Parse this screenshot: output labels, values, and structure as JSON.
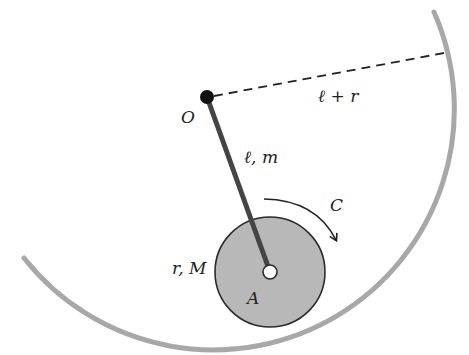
{
  "diagram": {
    "labels": {
      "pivot": "O",
      "rod": "ℓ, m",
      "track_radius": "ℓ + r",
      "couple": "C",
      "disc": "r, M",
      "disc_center": "A"
    },
    "colors": {
      "track": "#a8a8a8",
      "disc_fill": "#b8b8b8",
      "disc_stroke": "#2a2a2a",
      "rod": "#444444",
      "pivot": "#111111",
      "ink": "#222222"
    }
  }
}
